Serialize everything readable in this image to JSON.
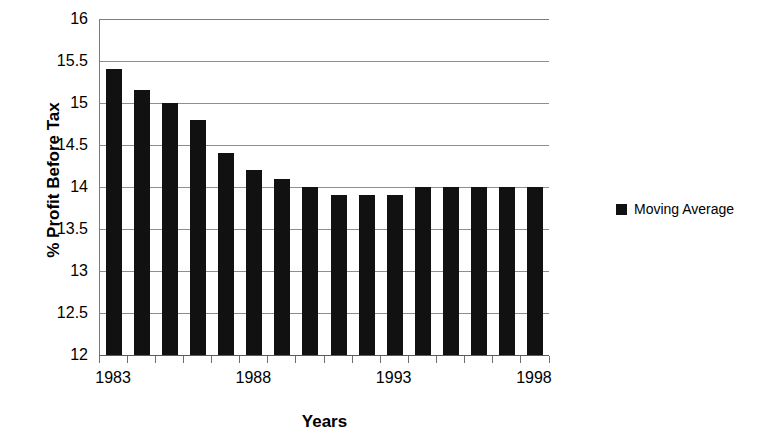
{
  "chart_data": {
    "type": "bar",
    "title": "",
    "xlabel": "Years",
    "ylabel": "% Profit Before Tax",
    "categories": [
      "1983",
      "1984",
      "1985",
      "1986",
      "1987",
      "1988",
      "1989",
      "1990",
      "1991",
      "1992",
      "1993",
      "1994",
      "1995",
      "1996",
      "1997",
      "1998"
    ],
    "values": [
      15.4,
      15.15,
      15.0,
      14.8,
      14.4,
      14.2,
      14.1,
      14.0,
      13.9,
      13.9,
      13.9,
      14.0,
      14.0,
      14.0,
      14.0,
      14.0
    ],
    "series": [
      {
        "name": "Moving Average",
        "values": [
          15.4,
          15.15,
          15.0,
          14.8,
          14.4,
          14.2,
          14.1,
          14.0,
          13.9,
          13.9,
          13.9,
          14.0,
          14.0,
          14.0,
          14.0,
          14.0
        ]
      }
    ],
    "ylim": [
      12,
      16
    ],
    "ytick_labels": [
      "16",
      "15.5",
      "15",
      "14.5",
      "14",
      "13.5",
      "13",
      "12.5",
      "12"
    ],
    "ytick_values": [
      16,
      15.5,
      15,
      14.5,
      14,
      13.5,
      13,
      12.5,
      12
    ],
    "xtick_labels": [
      "1983",
      "1988",
      "1993",
      "1998"
    ],
    "xtick_label_indices": [
      0,
      5,
      10,
      15
    ],
    "grid": "horizontal",
    "legend_position": "right",
    "bar_color": "#111111",
    "grid_color": "#8e8e8e",
    "axis_color": "#6f6f6f",
    "background_color": "#ffffff"
  },
  "legend": {
    "entries": [
      {
        "label": "Moving Average",
        "color": "#111111",
        "marker": "square-marker"
      }
    ]
  },
  "axes": {
    "y_title": "% Profit Before Tax",
    "x_title": "Years"
  }
}
